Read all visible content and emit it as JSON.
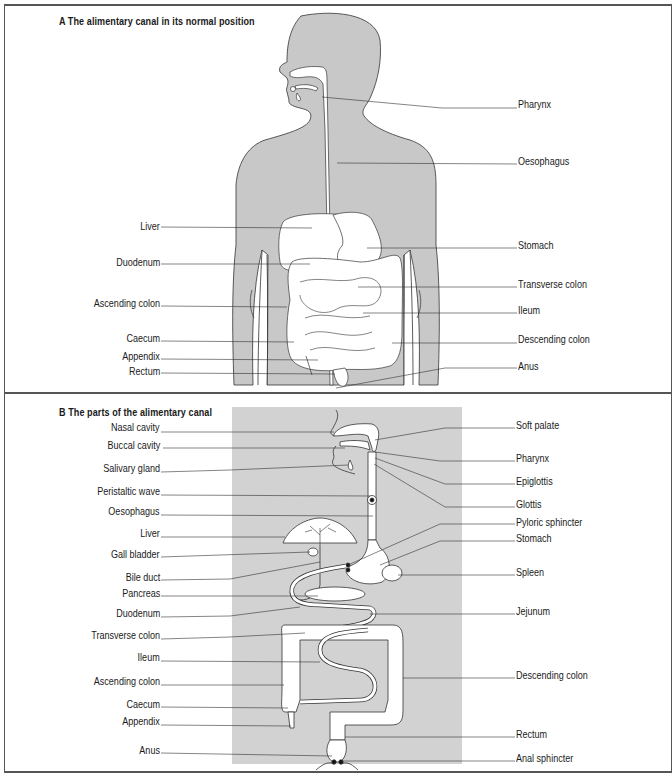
{
  "panel_a": {
    "title": "A  The alimentary canal in its normal position",
    "labels_left": [
      {
        "id": "liver",
        "text": "Liver",
        "y": 226
      },
      {
        "id": "duodenum",
        "text": "Duodenum",
        "y": 262
      },
      {
        "id": "ascending-colon",
        "text": "Ascending colon",
        "y": 303
      },
      {
        "id": "caecum",
        "text": "Caecum",
        "y": 338
      },
      {
        "id": "appendix",
        "text": "Appendix",
        "y": 356
      },
      {
        "id": "rectum",
        "text": "Rectum",
        "y": 371
      }
    ],
    "labels_right": [
      {
        "id": "pharynx",
        "text": "Pharynx",
        "y": 104
      },
      {
        "id": "oesophagus",
        "text": "Oesophagus",
        "y": 161
      },
      {
        "id": "stomach",
        "text": "Stomach",
        "y": 245
      },
      {
        "id": "transverse-colon",
        "text": "Transverse colon",
        "y": 284
      },
      {
        "id": "ileum",
        "text": "Ileum",
        "y": 310
      },
      {
        "id": "descending-colon",
        "text": "Descending colon",
        "y": 339
      },
      {
        "id": "anus",
        "text": "Anus",
        "y": 366
      }
    ]
  },
  "panel_b": {
    "title": "B  The parts of the alimentary canal",
    "labels_left": [
      {
        "id": "nasal-cavity",
        "text": "Nasal cavity",
        "y": 427
      },
      {
        "id": "buccal-cavity",
        "text": "Buccal cavity",
        "y": 445
      },
      {
        "id": "salivary-gland",
        "text": "Salivary gland",
        "y": 468
      },
      {
        "id": "peristaltic-wave",
        "text": "Peristaltic wave",
        "y": 491
      },
      {
        "id": "oesophagus",
        "text": "Oesophagus",
        "y": 511
      },
      {
        "id": "liver",
        "text": "Liver",
        "y": 533
      },
      {
        "id": "gall-bladder",
        "text": "Gall  bladder",
        "y": 554
      },
      {
        "id": "bile-duct",
        "text": "Bile duct",
        "y": 577
      },
      {
        "id": "pancreas",
        "text": "Pancreas",
        "y": 593
      },
      {
        "id": "duodenum",
        "text": "Duodenum",
        "y": 613
      },
      {
        "id": "transverse-colon",
        "text": "Transverse colon",
        "y": 635
      },
      {
        "id": "ileum",
        "text": "Ileum",
        "y": 657
      },
      {
        "id": "ascending-colon",
        "text": "Ascending colon",
        "y": 681
      },
      {
        "id": "caecum",
        "text": "Caecum",
        "y": 704
      },
      {
        "id": "appendix",
        "text": "Appendix",
        "y": 721
      },
      {
        "id": "anus",
        "text": "Anus",
        "y": 750
      }
    ],
    "labels_right": [
      {
        "id": "soft-palate",
        "text": "Soft palate",
        "y": 425
      },
      {
        "id": "pharynx",
        "text": "Pharynx",
        "y": 458
      },
      {
        "id": "epiglottis",
        "text": "Epiglottis",
        "y": 481
      },
      {
        "id": "glottis",
        "text": "Glottis",
        "y": 504
      },
      {
        "id": "pyloric-sphincter",
        "text": "Pyloric sphincter",
        "y": 522
      },
      {
        "id": "stomach",
        "text": "Stomach",
        "y": 538
      },
      {
        "id": "spleen",
        "text": "Spleen",
        "y": 572
      },
      {
        "id": "jejunum",
        "text": "Jejunum",
        "y": 611
      },
      {
        "id": "descending-colon",
        "text": "Descending colon",
        "y": 675
      },
      {
        "id": "rectum",
        "text": "Rectum",
        "y": 734
      },
      {
        "id": "anal-sphincter",
        "text": "Anal sphincter",
        "y": 758
      }
    ]
  },
  "colors": {
    "body_fill": "#c8c8c8",
    "backdrop_fill": "#d2d2d2",
    "organ_fill": "#ffffff",
    "outline": "#333333",
    "border": "#555555"
  }
}
